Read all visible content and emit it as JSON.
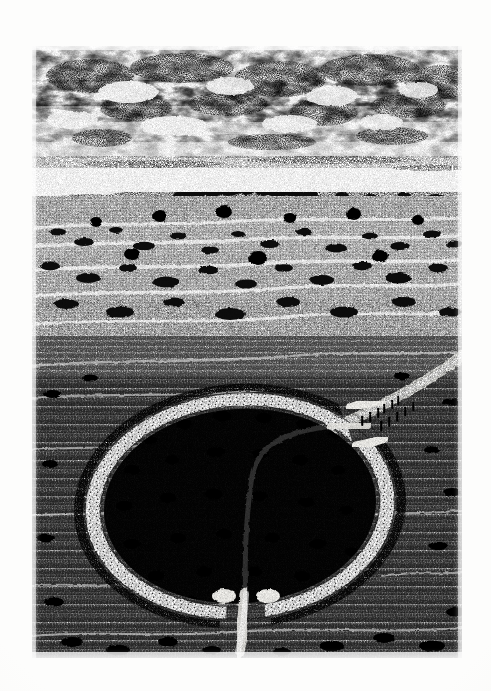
{
  "image": {
    "kind": "pen-and-ink stipple illustration",
    "subject": "Aerial reconstruction of a prehistoric circular earthwork enclosure (henge)",
    "palette": {
      "paper": "#fdfdfc",
      "plate_background": "#ffffff",
      "ink": "#111111",
      "mid_ink": "#4a4a4a",
      "light_ink": "#8d8d8d",
      "chalk_bank": "#f4f3ef"
    },
    "plate": {
      "left": 32,
      "top": 46,
      "width": 430,
      "height": 612
    }
  },
  "scene": {
    "sky": {
      "label": "Overcast stippled sky",
      "horizon_y": 150,
      "cloud_bands": [
        {
          "y": 12,
          "height": 46,
          "density": 0.92
        },
        {
          "y": 44,
          "height": 34,
          "density": 0.74
        },
        {
          "y": 70,
          "height": 26,
          "density": 0.55
        },
        {
          "y": 92,
          "height": 16,
          "density": 0.32
        }
      ],
      "cloud_puffs": [
        {
          "cx": 58,
          "cy": 30,
          "rx": 44,
          "ry": 17
        },
        {
          "cx": 150,
          "cy": 22,
          "rx": 52,
          "ry": 15
        },
        {
          "cx": 248,
          "cy": 33,
          "rx": 46,
          "ry": 18
        },
        {
          "cx": 338,
          "cy": 24,
          "rx": 50,
          "ry": 16
        },
        {
          "cx": 412,
          "cy": 36,
          "rx": 40,
          "ry": 17
        },
        {
          "cx": 104,
          "cy": 62,
          "rx": 36,
          "ry": 13
        },
        {
          "cx": 196,
          "cy": 58,
          "rx": 40,
          "ry": 12
        },
        {
          "cx": 292,
          "cy": 66,
          "rx": 34,
          "ry": 14
        },
        {
          "cx": 376,
          "cy": 60,
          "rx": 38,
          "ry": 12
        },
        {
          "cx": 70,
          "cy": 92,
          "rx": 30,
          "ry": 9
        },
        {
          "cx": 240,
          "cy": 96,
          "rx": 44,
          "ry": 8
        },
        {
          "cx": 360,
          "cy": 90,
          "rx": 36,
          "ry": 9
        }
      ]
    },
    "horizon": {
      "label": "Distant wooded ridge line",
      "y": 150,
      "ridge_points": "0,156 22,150 48,146 74,149 102,144 132,140 168,132 204,128 240,131 276,127 312,132 348,129 384,133 416,130 430,134"
    },
    "middle_ground": {
      "label": "Open grass plain with scattered scrub and trees",
      "top": 150,
      "bottom": 330,
      "tree_clumps": 120
    },
    "foreground": {
      "label": "Close grassland with vertical hatching",
      "top": 300,
      "bottom": 612
    }
  },
  "monument": {
    "name": "Circular enclosure earthwork",
    "description": "Oval chalk bank and internal ditch with two entrance causeways",
    "centre": {
      "cx": 208,
      "cy": 460
    },
    "outer_radius": {
      "rx": 160,
      "ry": 118
    },
    "inner_radius": {
      "rx": 136,
      "ry": 97
    },
    "rotation_deg": -4,
    "bank_width": 13,
    "entrances": [
      {
        "name": "north-east-entrance",
        "angle_deg": 18,
        "label": "Main causeway entrance"
      },
      {
        "name": "south-entrance",
        "angle_deg": 96,
        "label": "Southern causeway entrance"
      }
    ],
    "interior_features": {
      "label": "Pits / scrub clumps inside the enclosure",
      "count": 34
    }
  },
  "trackway": {
    "label": "Approach trackway from the north-east",
    "points": "298,380 340,366 380,344 412,322 430,306",
    "width": 9,
    "second_track": {
      "label": "Path leaving the southern entrance",
      "points": "214,566 212,590 206,612"
    }
  },
  "figures": {
    "label": "Human figures walking the causeway",
    "count": 11,
    "positions": [
      {
        "x": 330,
        "y": 378
      },
      {
        "x": 338,
        "y": 374
      },
      {
        "x": 346,
        "y": 370
      },
      {
        "x": 352,
        "y": 366
      },
      {
        "x": 360,
        "y": 362
      },
      {
        "x": 366,
        "y": 358
      },
      {
        "x": 349,
        "y": 383
      },
      {
        "x": 357,
        "y": 379
      },
      {
        "x": 365,
        "y": 374
      },
      {
        "x": 373,
        "y": 369
      },
      {
        "x": 381,
        "y": 364
      }
    ]
  },
  "caption": {
    "visible": false,
    "text": ""
  }
}
